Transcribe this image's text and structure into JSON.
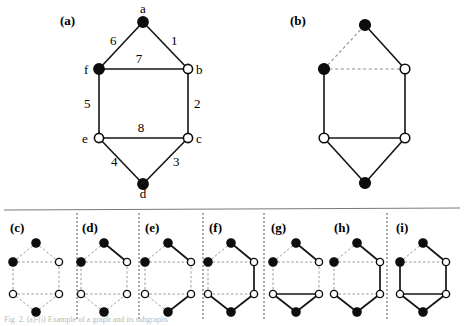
{
  "figure": {
    "caption_bottom": "Fig. 2. (a)-(i) Example of a graph and its subgraphs",
    "colors": {
      "edge_solid": "#141414",
      "edge_dashed": "#8d8d8d",
      "node_fill_black": "#0d0d0d",
      "node_fill_white": "#ffffff",
      "node_stroke": "#0d0d0d",
      "divider": "#555555",
      "rule": "#7a7a7a"
    }
  },
  "panels": {
    "a": {
      "label": "(a)",
      "nodes": [
        {
          "id": "a",
          "label": "a",
          "fill": "black"
        },
        {
          "id": "b",
          "label": "b",
          "fill": "white"
        },
        {
          "id": "c",
          "label": "c",
          "fill": "white"
        },
        {
          "id": "d",
          "label": "d",
          "fill": "black"
        },
        {
          "id": "e",
          "label": "e",
          "fill": "white"
        },
        {
          "id": "f",
          "label": "f",
          "fill": "black"
        }
      ],
      "edges": [
        {
          "from": "a",
          "to": "b",
          "label": "1",
          "style": "solid"
        },
        {
          "from": "b",
          "to": "c",
          "label": "2",
          "style": "solid"
        },
        {
          "from": "c",
          "to": "d",
          "label": "3",
          "style": "solid"
        },
        {
          "from": "d",
          "to": "e",
          "label": "4",
          "style": "solid"
        },
        {
          "from": "e",
          "to": "f",
          "label": "5",
          "style": "solid"
        },
        {
          "from": "f",
          "to": "a",
          "label": "6",
          "style": "solid"
        },
        {
          "from": "f",
          "to": "b",
          "label": "7",
          "style": "solid"
        },
        {
          "from": "e",
          "to": "c",
          "label": "8",
          "style": "solid"
        }
      ]
    },
    "b": {
      "label": "(b)",
      "nodes": [
        {
          "id": "a",
          "fill": "black"
        },
        {
          "id": "b",
          "fill": "white"
        },
        {
          "id": "c",
          "fill": "white"
        },
        {
          "id": "d",
          "fill": "black"
        },
        {
          "id": "e",
          "fill": "white"
        },
        {
          "id": "f",
          "fill": "black"
        }
      ],
      "edges": [
        {
          "from": "a",
          "to": "b",
          "style": "solid"
        },
        {
          "from": "b",
          "to": "c",
          "style": "solid"
        },
        {
          "from": "c",
          "to": "d",
          "style": "solid"
        },
        {
          "from": "d",
          "to": "e",
          "style": "solid"
        },
        {
          "from": "e",
          "to": "f",
          "style": "solid"
        },
        {
          "from": "f",
          "to": "a",
          "style": "dashed"
        },
        {
          "from": "f",
          "to": "b",
          "style": "dashed"
        },
        {
          "from": "e",
          "to": "c",
          "style": "solid"
        }
      ]
    },
    "c": {
      "label": "(c)",
      "edges": [
        {
          "from": "a",
          "to": "b",
          "style": "dashed"
        },
        {
          "from": "b",
          "to": "c",
          "style": "dashed"
        },
        {
          "from": "c",
          "to": "d",
          "style": "dashed"
        },
        {
          "from": "d",
          "to": "e",
          "style": "dashed"
        },
        {
          "from": "e",
          "to": "f",
          "style": "dashed"
        },
        {
          "from": "f",
          "to": "a",
          "style": "dashed"
        },
        {
          "from": "f",
          "to": "b",
          "style": "dashed"
        },
        {
          "from": "e",
          "to": "c",
          "style": "dashed"
        }
      ]
    },
    "d": {
      "label": "(d)",
      "edges": [
        {
          "from": "a",
          "to": "b",
          "style": "solid"
        },
        {
          "from": "b",
          "to": "c",
          "style": "dashed"
        },
        {
          "from": "c",
          "to": "d",
          "style": "dashed"
        },
        {
          "from": "d",
          "to": "e",
          "style": "dashed"
        },
        {
          "from": "e",
          "to": "f",
          "style": "dashed"
        },
        {
          "from": "f",
          "to": "a",
          "style": "dashed"
        },
        {
          "from": "f",
          "to": "b",
          "style": "dashed"
        },
        {
          "from": "e",
          "to": "c",
          "style": "dashed"
        }
      ]
    },
    "e": {
      "label": "(e)",
      "edges": [
        {
          "from": "a",
          "to": "b",
          "style": "solid"
        },
        {
          "from": "b",
          "to": "c",
          "style": "dashed"
        },
        {
          "from": "c",
          "to": "d",
          "style": "solid"
        },
        {
          "from": "d",
          "to": "e",
          "style": "dashed"
        },
        {
          "from": "e",
          "to": "f",
          "style": "dashed"
        },
        {
          "from": "f",
          "to": "a",
          "style": "dashed"
        },
        {
          "from": "f",
          "to": "b",
          "style": "dashed"
        },
        {
          "from": "e",
          "to": "c",
          "style": "dashed"
        }
      ]
    },
    "f": {
      "label": "(f)",
      "edges": [
        {
          "from": "a",
          "to": "b",
          "style": "solid"
        },
        {
          "from": "b",
          "to": "c",
          "style": "solid"
        },
        {
          "from": "c",
          "to": "d",
          "style": "solid"
        },
        {
          "from": "d",
          "to": "e",
          "style": "solid"
        },
        {
          "from": "e",
          "to": "f",
          "style": "dashed"
        },
        {
          "from": "f",
          "to": "a",
          "style": "dashed"
        },
        {
          "from": "f",
          "to": "b",
          "style": "dashed"
        },
        {
          "from": "e",
          "to": "c",
          "style": "dashed"
        }
      ]
    },
    "g": {
      "label": "(g)",
      "edges": [
        {
          "from": "a",
          "to": "b",
          "style": "solid"
        },
        {
          "from": "b",
          "to": "c",
          "style": "dashed"
        },
        {
          "from": "c",
          "to": "d",
          "style": "solid"
        },
        {
          "from": "d",
          "to": "e",
          "style": "solid"
        },
        {
          "from": "e",
          "to": "f",
          "style": "dashed"
        },
        {
          "from": "f",
          "to": "a",
          "style": "dashed"
        },
        {
          "from": "f",
          "to": "b",
          "style": "dashed"
        },
        {
          "from": "e",
          "to": "c",
          "style": "solid"
        }
      ]
    },
    "h": {
      "label": "(h)",
      "edges": [
        {
          "from": "a",
          "to": "b",
          "style": "solid"
        },
        {
          "from": "b",
          "to": "c",
          "style": "solid"
        },
        {
          "from": "c",
          "to": "d",
          "style": "solid"
        },
        {
          "from": "d",
          "to": "e",
          "style": "solid"
        },
        {
          "from": "e",
          "to": "f",
          "style": "dashed"
        },
        {
          "from": "f",
          "to": "a",
          "style": "dashed"
        },
        {
          "from": "f",
          "to": "b",
          "style": "dashed"
        },
        {
          "from": "e",
          "to": "c",
          "style": "dashed"
        }
      ]
    },
    "i": {
      "label": "(i)",
      "edges": [
        {
          "from": "a",
          "to": "b",
          "style": "solid"
        },
        {
          "from": "b",
          "to": "c",
          "style": "solid"
        },
        {
          "from": "c",
          "to": "d",
          "style": "solid"
        },
        {
          "from": "d",
          "to": "e",
          "style": "solid"
        },
        {
          "from": "e",
          "to": "f",
          "style": "solid"
        },
        {
          "from": "f",
          "to": "a",
          "style": "dashed"
        },
        {
          "from": "f",
          "to": "b",
          "style": "dashed"
        },
        {
          "from": "e",
          "to": "c",
          "style": "solid"
        }
      ]
    }
  }
}
